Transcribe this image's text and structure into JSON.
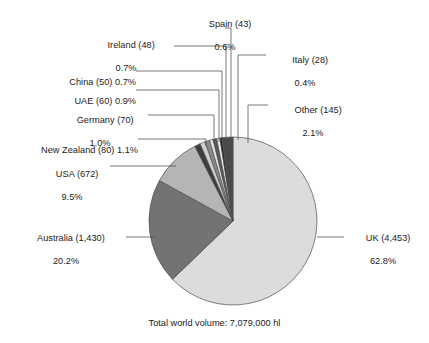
{
  "figure": {
    "footnote": "Total world volume: 7,079,000 hl",
    "background": "#ffffff",
    "text_color": "#1a1a1a",
    "leader_line_color": "#555555",
    "slice_outline_color": "#4d4d4d"
  },
  "chart_data": {
    "type": "pie",
    "title": "",
    "subtitle": "",
    "xlabel": "",
    "ylabel": "",
    "units": "hl",
    "total_label": "Total world volume: 7,079,000 hl",
    "total_value": 7079000,
    "start_angle_deg": 0,
    "direction": "clockwise",
    "legend_position": "callout-labels",
    "grid": false,
    "value_units": "thousand hl",
    "categories": [
      "UK",
      "Australia",
      "USA",
      "New Zealand",
      "Germany",
      "UAE",
      "China",
      "Ireland",
      "Spain",
      "Italy",
      "Other"
    ],
    "values": [
      4453,
      1430,
      672,
      80,
      70,
      60,
      50,
      48,
      43,
      28,
      145
    ],
    "percentages": [
      62.8,
      20.2,
      9.5,
      1.1,
      1.0,
      0.9,
      0.7,
      0.7,
      0.6,
      0.4,
      2.1
    ],
    "colors": [
      "#dcdcdc",
      "#737373",
      "#b5b5b5",
      "#3d3d3d",
      "#cfcfcf",
      "#8a8a8a",
      "#e2e2e2",
      "#5a5a5a",
      "#f2f2f2",
      "#1f1f1f",
      "#4a4a4a"
    ],
    "slices": [
      {
        "name": "UK",
        "value": 4453,
        "percent": 62.8,
        "label_line1": "UK (4,453)",
        "label_line2": "62.8%",
        "color": "#dcdcdc"
      },
      {
        "name": "Australia",
        "value": 1430,
        "percent": 20.2,
        "label_line1": "Australia (1,430)",
        "label_line2": "20.2%",
        "color": "#737373"
      },
      {
        "name": "USA",
        "value": 672,
        "percent": 9.5,
        "label_line1": "USA (672)",
        "label_line2": "9.5%",
        "color": "#b5b5b5"
      },
      {
        "name": "New Zealand",
        "value": 80,
        "percent": 1.1,
        "label_line1": "New Zealand (80) 1.1%",
        "label_line2": "",
        "color": "#3d3d3d"
      },
      {
        "name": "Germany",
        "value": 70,
        "percent": 1.0,
        "label_line1": "Germany (70)",
        "label_line2": "1.0%",
        "color": "#cfcfcf"
      },
      {
        "name": "UAE",
        "value": 60,
        "percent": 0.9,
        "label_line1": "UAE (60) 0.9%",
        "label_line2": "",
        "color": "#8a8a8a"
      },
      {
        "name": "China",
        "value": 50,
        "percent": 0.7,
        "label_line1": "China (50) 0.7%",
        "label_line2": "",
        "color": "#e2e2e2"
      },
      {
        "name": "Ireland",
        "value": 48,
        "percent": 0.7,
        "label_line1": "Ireland (48)",
        "label_line2": "0.7%",
        "color": "#5a5a5a"
      },
      {
        "name": "Spain",
        "value": 43,
        "percent": 0.6,
        "label_line1": "Spain (43)",
        "label_line2": "0.6%",
        "color": "#f2f2f2"
      },
      {
        "name": "Italy",
        "value": 28,
        "percent": 0.4,
        "label_line1": "Italy (28)",
        "label_line2": "0.4%",
        "color": "#1f1f1f"
      },
      {
        "name": "Other",
        "value": 145,
        "percent": 2.1,
        "label_line1": "Other (145)",
        "label_line2": "2.1%",
        "color": "#4a4a4a"
      }
    ]
  }
}
